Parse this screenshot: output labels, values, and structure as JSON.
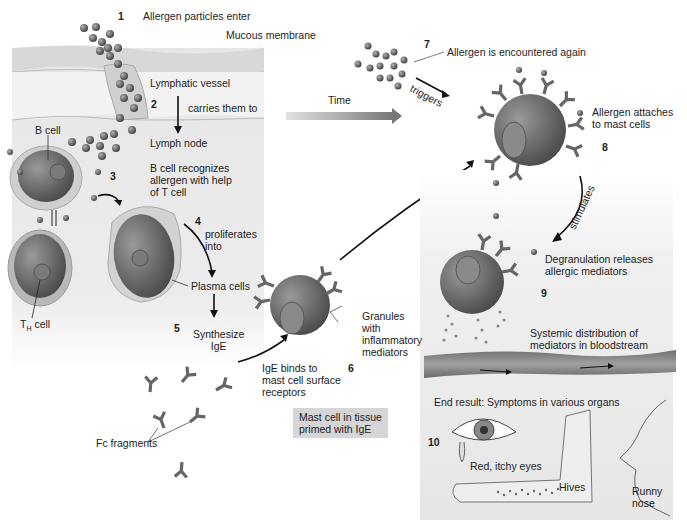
{
  "diagram": {
    "type": "process-flow",
    "colors": {
      "left_panel_bg": "#e6e6e6",
      "membrane": "#d9d9d9",
      "right_panel_bg": "#ececec",
      "cell_body": "#6e6e6e",
      "cell_nucleus": "#8a8a8a",
      "antibody": "#6a6a6a",
      "vessel": "#8c8c8c",
      "time_arrow_start": "#e0e0e0",
      "time_arrow_end": "#7a7a7a",
      "label_box": "#d6d6d6"
    },
    "steps": [
      {
        "number": "1",
        "label": "Allergen particles enter"
      },
      {
        "number": "2",
        "label": "carries them to"
      },
      {
        "number": "3",
        "label": "B cell recognizes allergen with help of T cell"
      },
      {
        "number": "4",
        "label": "proliferates into"
      },
      {
        "number": "5",
        "label": "Synthesize IgE"
      },
      {
        "number": "6",
        "label": "IgE binds to mast cell surface receptors"
      },
      {
        "number": "7",
        "label": "Allergen is encountered again"
      },
      {
        "number": "8",
        "label": "Allergen attaches to mast cells"
      },
      {
        "number": "9",
        "label": "Degranulation releases allergic mediators"
      },
      {
        "number": "10",
        "label": "End result: Symptoms in various organs"
      }
    ],
    "labels": {
      "mucous_membrane": "Mucous membrane",
      "lymphatic_vessel": "Lymphatic vessel",
      "lymph_node": "Lymph node",
      "b_cell": "B cell",
      "th_cell_T": "T",
      "th_cell_sub": "H",
      "th_cell_rest": " cell",
      "plasma_cells": "Plasma cells",
      "fc_fragments": "Fc fragments",
      "granules_1": "Granules",
      "granules_2": "with",
      "granules_3": "inflammatory",
      "granules_4": "mediators",
      "mast_cell_box_1": "Mast cell in tissue",
      "mast_cell_box_2": "primed with IgE",
      "time": "Time",
      "triggers": "triggers",
      "stimulates": "stimulates",
      "systemic_1": "Systemic distribution of",
      "systemic_2": "mediators in bloodstream",
      "symptom_eyes": "Red, itchy eyes",
      "symptom_hives": "Hives",
      "symptom_nose_1": "Runny",
      "symptom_nose_2": "nose"
    },
    "text_lines": {
      "step3_1": "B cell recognizes",
      "step3_2": "allergen with help",
      "step3_3": "of T cell",
      "step4_1": "proliferates",
      "step4_2": "into",
      "step5_1": "Synthesize",
      "step5_2": "IgE",
      "step6_1": "IgE binds to",
      "step6_2": "mast cell surface",
      "step6_3": "receptors",
      "step8_1": "Allergen attaches",
      "step8_2": "to mast cells",
      "step9_1": "Degranulation releases",
      "step9_2": "allergic mediators"
    }
  }
}
